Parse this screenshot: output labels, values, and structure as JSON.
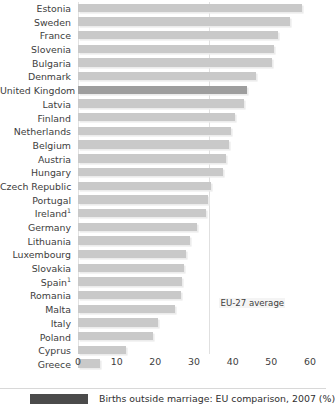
{
  "chart_data": {
    "type": "bar",
    "orientation": "horizontal",
    "title": "Births outside marriage: EU comparison, 2007 (%)",
    "xlabel": "",
    "ylabel": "",
    "xlim": [
      0,
      60
    ],
    "xticks": [
      0,
      10,
      20,
      30,
      40,
      50,
      60
    ],
    "grid": true,
    "grid_axis": "x",
    "legend": {
      "position": "bottom",
      "entries": [
        {
          "label": "Births outside marriage: EU comparison, 2007 (%)",
          "color": "#4b4b4b"
        }
      ]
    },
    "annotations": [
      {
        "text": "EU-27 average",
        "value": 34.0,
        "type": "reference-line-label"
      }
    ],
    "footnotes": [
      "1"
    ],
    "highlight": {
      "category": "United Kingdom",
      "color": "#9e9e9e"
    },
    "bar_color": "#c9c9c9",
    "categories": [
      "Estonia",
      "Sweden",
      "France",
      "Slovenia",
      "Bulgaria",
      "Denmark",
      "United Kingdom",
      "Latvia",
      "Finland",
      "Netherlands",
      "Belgium",
      "Austria",
      "Hungary",
      "Czech Republic",
      "Portugal",
      "Ireland",
      "Germany",
      "Lithuania",
      "Luxembourg",
      "Slovakia",
      "Spain",
      "Romania",
      "Malta",
      "Italy",
      "Poland",
      "Cyprus",
      "Greece"
    ],
    "values": [
      58.0,
      54.8,
      51.6,
      50.8,
      50.2,
      46.1,
      43.7,
      43.0,
      40.6,
      39.5,
      39.0,
      38.3,
      37.5,
      34.5,
      33.6,
      33.2,
      30.8,
      29.0,
      28.0,
      27.5,
      27.0,
      26.7,
      25.2,
      20.7,
      19.5,
      12.4,
      5.8
    ],
    "value_labels": [
      "58",
      "55",
      "52",
      "51",
      "50",
      "46",
      "44",
      "43",
      "41",
      "40",
      "39",
      "38",
      "38",
      "35",
      "34",
      "33",
      "31",
      "29",
      "28",
      "28",
      "27",
      "27",
      "25",
      "21",
      "20",
      "12",
      "6"
    ],
    "superscripts": {
      "Ireland": "1",
      "Spain": "1"
    },
    "eu27_average": 34.0
  },
  "legend": {
    "caption": "Births outside marriage: EU comparison, 2007 (%)",
    "swatch_color": "#4b4b4b"
  },
  "annotation": {
    "eu_average_label": "EU-27 average"
  }
}
